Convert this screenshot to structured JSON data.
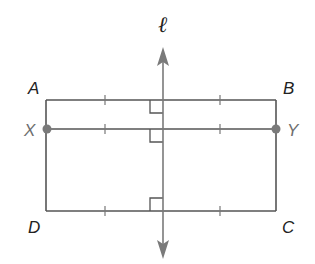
{
  "diagram": {
    "type": "geometry",
    "colors": {
      "stroke": "#555555",
      "line_l": "#7a7a7a",
      "points": "#7a7a7a",
      "label": "#222222",
      "label_gray": "#6e6e6e"
    },
    "labels": {
      "line": "ℓ",
      "A": "A",
      "B": "B",
      "C": "C",
      "D": "D",
      "X": "X",
      "Y": "Y"
    },
    "shapes": {
      "rectangle": {
        "vertices": [
          "A",
          "B",
          "C",
          "D"
        ]
      },
      "segment": {
        "endpoints": [
          "X",
          "Y"
        ],
        "endpoint_markers": "filled-dots"
      },
      "line_l": {
        "arrows": "both-ends",
        "perpendicular_to": [
          "AB",
          "XY",
          "DC"
        ]
      }
    },
    "congruence_ticks": {
      "AB": 2,
      "XY": 2,
      "DC": 2
    },
    "right_angle_markers": 3
  }
}
